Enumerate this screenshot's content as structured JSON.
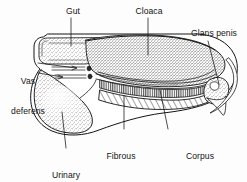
{
  "figure": {
    "type": "anatomical-diagram",
    "background_color": "#fdfdfd",
    "ink_color": "#141414",
    "width": 247,
    "height": 182
  },
  "labels": {
    "gut": "Gut",
    "cloaca": "Cloaca",
    "glans_penis": "Glans penis",
    "vas_deferens_line1": "Vas",
    "vas_deferens_line2": "deferens",
    "urinary_bladder_line1": "Urinary",
    "urinary_bladder_line2": "bladder",
    "fibrous_tissue_line1": "Fibrous",
    "fibrous_tissue_line2": "tissue",
    "corpus_cavernosum_line1": "Corpus",
    "corpus_cavernosum_line2": "cavernosum"
  },
  "structures": [
    {
      "name": "gut",
      "shading": "stipple"
    },
    {
      "name": "cloaca",
      "shading": "stipple"
    },
    {
      "name": "glans-penis",
      "shading": "stipple"
    },
    {
      "name": "vas-deferens",
      "shading": "outline-arrow"
    },
    {
      "name": "urinary-bladder",
      "shading": "stipple"
    },
    {
      "name": "fibrous-tissue",
      "shading": "diagonal-hatch"
    },
    {
      "name": "corpus-cavernosum",
      "shading": "comb-strokes"
    }
  ]
}
